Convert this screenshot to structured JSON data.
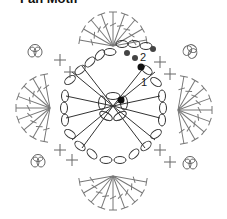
{
  "title": "Fan Motif",
  "diagram": {
    "type": "crochet-chart",
    "labels": {
      "row1": "1",
      "row2": "2"
    },
    "colors": {
      "stroke": "#555555",
      "marker": "#111111",
      "marker_gray": "#444444"
    }
  }
}
